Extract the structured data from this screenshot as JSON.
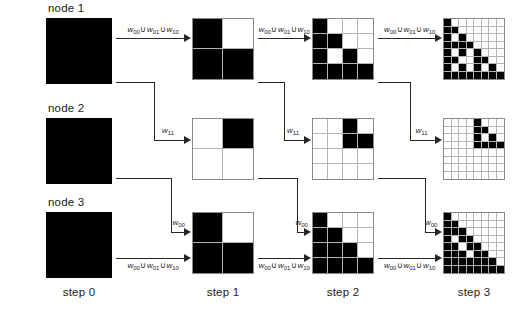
{
  "figure": {
    "title": "",
    "background": "#ffffff",
    "ink": "#000000",
    "gridline_color": "#b4b4b4"
  },
  "row_labels": [
    {
      "id": "node1",
      "text": "node 1"
    },
    {
      "id": "node2",
      "text": "node 2"
    },
    {
      "id": "node3",
      "text": "node 3"
    }
  ],
  "column_labels": [
    {
      "id": "step0",
      "text": "step 0"
    },
    {
      "id": "step1",
      "text": "step 1"
    },
    {
      "id": "step2",
      "text": "step 2"
    },
    {
      "id": "step3",
      "text": "step 3"
    }
  ],
  "operators": {
    "w00": "w",
    "w01": "w",
    "w10": "w",
    "w11": "w",
    "sub00": "00",
    "sub01": "01",
    "sub10": "10",
    "sub11": "11",
    "union": "∪"
  },
  "arrow_labels": {
    "union_three": "w00 ∪ w01 ∪ w10",
    "w11": "w11",
    "w00": "w00"
  },
  "chart_data": {
    "type": "diagram-grid",
    "resolutions": [
      1,
      2,
      4,
      8
    ],
    "nodes": [
      {
        "name": "node 1",
        "steps": [
          {
            "step": 0,
            "n": 1,
            "cells": [
              [
                1
              ]
            ]
          },
          {
            "step": 1,
            "n": 2,
            "cells": [
              [
                1,
                0
              ],
              [
                1,
                1
              ]
            ]
          },
          {
            "step": 2,
            "n": 4,
            "cells": [
              [
                1,
                0,
                0,
                0
              ],
              [
                1,
                1,
                0,
                0
              ],
              [
                1,
                0,
                1,
                0
              ],
              [
                1,
                1,
                1,
                1
              ]
            ]
          },
          {
            "step": 3,
            "n": 8,
            "cells": [
              [
                1,
                0,
                0,
                0,
                0,
                0,
                0,
                0
              ],
              [
                1,
                1,
                0,
                0,
                0,
                0,
                0,
                0
              ],
              [
                1,
                0,
                1,
                0,
                0,
                0,
                0,
                0
              ],
              [
                1,
                1,
                1,
                1,
                0,
                0,
                0,
                0
              ],
              [
                1,
                0,
                1,
                0,
                1,
                0,
                0,
                0
              ],
              [
                1,
                1,
                0,
                0,
                1,
                1,
                0,
                0
              ],
              [
                1,
                0,
                1,
                0,
                1,
                0,
                1,
                0
              ],
              [
                1,
                1,
                1,
                1,
                1,
                1,
                1,
                1
              ]
            ]
          }
        ]
      },
      {
        "name": "node 2",
        "steps": [
          {
            "step": 0,
            "n": 1,
            "cells": [
              [
                1
              ]
            ]
          },
          {
            "step": 1,
            "n": 2,
            "cells": [
              [
                0,
                1
              ],
              [
                0,
                0
              ]
            ]
          },
          {
            "step": 2,
            "n": 4,
            "cells": [
              [
                0,
                0,
                1,
                0
              ],
              [
                0,
                0,
                1,
                1
              ],
              [
                0,
                0,
                0,
                0
              ],
              [
                0,
                0,
                0,
                0
              ]
            ]
          },
          {
            "step": 3,
            "n": 8,
            "cells": [
              [
                0,
                0,
                0,
                0,
                1,
                0,
                0,
                0
              ],
              [
                0,
                0,
                0,
                0,
                1,
                1,
                0,
                0
              ],
              [
                0,
                0,
                0,
                0,
                1,
                0,
                1,
                0
              ],
              [
                0,
                0,
                0,
                0,
                1,
                1,
                1,
                1
              ],
              [
                0,
                0,
                0,
                0,
                0,
                0,
                0,
                0
              ],
              [
                0,
                0,
                0,
                0,
                0,
                0,
                0,
                0
              ],
              [
                0,
                0,
                0,
                0,
                0,
                0,
                0,
                0
              ],
              [
                0,
                0,
                0,
                0,
                0,
                0,
                0,
                0
              ]
            ]
          }
        ]
      },
      {
        "name": "node 3",
        "steps": [
          {
            "step": 0,
            "n": 1,
            "cells": [
              [
                1
              ]
            ]
          },
          {
            "step": 1,
            "n": 2,
            "cells": [
              [
                1,
                0
              ],
              [
                1,
                1
              ]
            ]
          },
          {
            "step": 2,
            "n": 4,
            "cells": [
              [
                1,
                0,
                0,
                0
              ],
              [
                1,
                1,
                0,
                0
              ],
              [
                1,
                1,
                1,
                0
              ],
              [
                1,
                1,
                1,
                1
              ]
            ]
          },
          {
            "step": 3,
            "n": 8,
            "cells": [
              [
                1,
                0,
                0,
                0,
                0,
                0,
                0,
                0
              ],
              [
                1,
                1,
                0,
                0,
                0,
                0,
                0,
                0
              ],
              [
                1,
                1,
                1,
                0,
                0,
                0,
                0,
                0
              ],
              [
                1,
                0,
                1,
                1,
                0,
                0,
                0,
                0
              ],
              [
                1,
                1,
                0,
                1,
                1,
                0,
                0,
                0
              ],
              [
                1,
                1,
                1,
                0,
                1,
                1,
                0,
                0
              ],
              [
                1,
                1,
                1,
                1,
                1,
                1,
                1,
                0
              ],
              [
                1,
                1,
                1,
                1,
                1,
                1,
                1,
                1
              ]
            ]
          }
        ]
      }
    ],
    "transitions": [
      {
        "from": "node 1",
        "to": "node 1",
        "label": "w00 ∪ w01 ∪ w10"
      },
      {
        "from": "node 1",
        "to": "node 2",
        "label": "w11"
      },
      {
        "from": "node 2",
        "to": "node 3",
        "label": "w00"
      },
      {
        "from": "node 3",
        "to": "node 3",
        "label": "w00 ∪ w01 ∪ w10"
      }
    ]
  }
}
